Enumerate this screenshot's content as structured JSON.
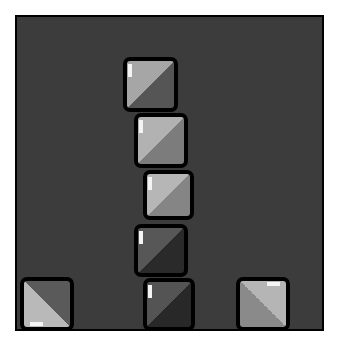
{
  "game": {
    "board": {
      "background": "#3c3c3c",
      "border": "#000000"
    },
    "blocks": [
      {
        "id": "block-top",
        "x": 123,
        "y": 57,
        "w": 55,
        "h": 55,
        "light": "#a6a6a6",
        "dark": "#555555",
        "diag": "tl-br",
        "spec": "left"
      },
      {
        "id": "block-2",
        "x": 134,
        "y": 113,
        "w": 54,
        "h": 55,
        "light": "#b2b2b2",
        "dark": "#7c7c7c",
        "diag": "tl-br",
        "spec": "left"
      },
      {
        "id": "block-3",
        "x": 143,
        "y": 170,
        "w": 51,
        "h": 50,
        "light": "#b6b6b6",
        "dark": "#858585",
        "diag": "tl-br",
        "spec": "left"
      },
      {
        "id": "block-4",
        "x": 134,
        "y": 224,
        "w": 54,
        "h": 53,
        "light": "#575757",
        "dark": "#2a2a2a",
        "diag": "tl-br",
        "spec": "left"
      },
      {
        "id": "block-bottom-center",
        "x": 143,
        "y": 278,
        "w": 52,
        "h": 53,
        "light": "#545454",
        "dark": "#282828",
        "diag": "tl-br",
        "spec": "left"
      },
      {
        "id": "block-bottom-left",
        "x": 20,
        "y": 277,
        "w": 54,
        "h": 54,
        "light": "#b9b9b9",
        "dark": "#5a5a5a",
        "diag": "bl-tr",
        "spec": "bottom"
      },
      {
        "id": "block-bottom-right",
        "x": 236,
        "y": 277,
        "w": 54,
        "h": 54,
        "light": "#b5b5b5",
        "dark": "#8a8a8a",
        "diag": "tr-bl",
        "spec": "top"
      }
    ]
  }
}
